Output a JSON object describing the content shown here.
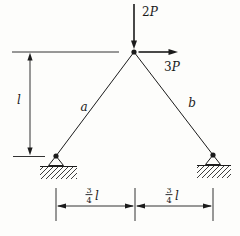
{
  "figure": {
    "background": "#fdfdfb",
    "ink_color": "#1b1b1b",
    "loads": {
      "vertical": {
        "num": "2",
        "sym": "P"
      },
      "horizontal": {
        "num": "3",
        "sym": "P"
      }
    },
    "bars": {
      "left": "a",
      "right": "b"
    },
    "dimensions": {
      "height": "l",
      "spans": [
        {
          "num": "3",
          "den": "4",
          "unit": "l"
        },
        {
          "num": "3",
          "den": "4",
          "unit": "l"
        }
      ]
    }
  }
}
